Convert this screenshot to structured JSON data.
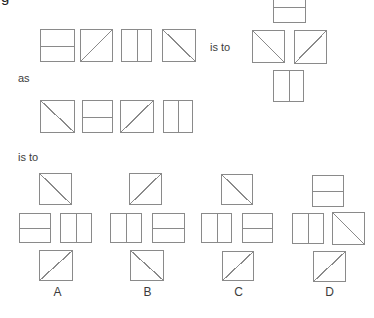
{
  "page": {
    "corner_fragment": "g"
  },
  "connectors": {
    "is_to_top": "is to",
    "as": "as",
    "is_to_bottom": "is to"
  },
  "colors": {
    "line": "#8a8a8a",
    "text": "#3c3c3c",
    "background": "#ffffff"
  },
  "puzzle": {
    "first_sequence": [
      "horizontal",
      "backslash",
      "vertical",
      "slash"
    ],
    "first_result": {
      "top": "horizontal",
      "left": "slash",
      "right": "backslash",
      "bottom": "vertical"
    },
    "second_sequence": [
      "slash",
      "horizontal",
      "backslash",
      "vertical"
    ],
    "options": [
      {
        "label": "A",
        "top": "slash",
        "left": "horizontal",
        "right": "vertical",
        "bottom": "backslash"
      },
      {
        "label": "B",
        "top": "backslash",
        "left": "vertical",
        "right": "horizontal",
        "bottom": "slash"
      },
      {
        "label": "C",
        "top": "slash",
        "left": "vertical",
        "right": "horizontal",
        "bottom": "backslash"
      },
      {
        "label": "D",
        "top": "horizontal",
        "left": "vertical",
        "right": "slash",
        "bottom": "backslash"
      }
    ]
  }
}
